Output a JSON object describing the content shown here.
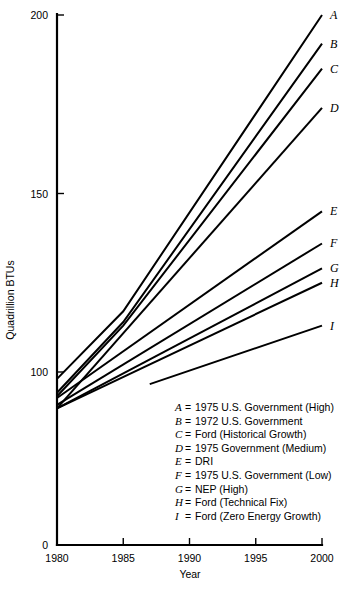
{
  "chart_data": {
    "type": "line",
    "title": "",
    "xlabel": "Year",
    "ylabel": "Quadrillion BTUs",
    "xlim": [
      1980,
      2000
    ],
    "ylim": [
      0,
      200
    ],
    "xticks": [
      1980,
      1985,
      1990,
      1995,
      2000
    ],
    "xticklabels": [
      "1980",
      "1985",
      "1990",
      "1995",
      "2000"
    ],
    "yticks": [
      0,
      100,
      150,
      200
    ],
    "yticklabels": [
      "0",
      "100",
      "150",
      "200"
    ],
    "grid": false,
    "legend_position": "inside-lower-right",
    "axis_note": "y-axis compressed below 100",
    "series": [
      {
        "key": "A",
        "name": "1975 U.S. Government (High)",
        "x": [
          1980,
          1985,
          2000
        ],
        "y": [
          96,
          117,
          200
        ]
      },
      {
        "key": "B",
        "name": "1972 U.S. Government",
        "x": [
          1980,
          1985,
          2000
        ],
        "y": [
          88,
          114,
          192
        ]
      },
      {
        "key": "C",
        "name": "Ford (Historical Growth)",
        "x": [
          1980,
          1985,
          2000
        ],
        "y": [
          86,
          113,
          185
        ]
      },
      {
        "key": "D",
        "name": "1975 Government (Medium)",
        "x": [
          1980,
          2000
        ],
        "y": [
          79,
          174
        ]
      },
      {
        "key": "E",
        "name": "DRI",
        "x": [
          1980,
          2000
        ],
        "y": [
          85,
          145
        ]
      },
      {
        "key": "F",
        "name": "1975 U.S. Government (Low)",
        "x": [
          1980,
          2000
        ],
        "y": [
          81,
          136
        ]
      },
      {
        "key": "G",
        "name": "NEP (High)",
        "x": [
          1980,
          2000
        ],
        "y": [
          79,
          129
        ]
      },
      {
        "key": "H",
        "name": "Ford (Technical Fix)",
        "x": [
          1980,
          2000
        ],
        "y": [
          79,
          125
        ]
      },
      {
        "key": "I",
        "name": "Ford (Zero Energy Growth)",
        "x": [
          1987,
          2000
        ],
        "y": [
          93,
          113
        ]
      }
    ],
    "legend_entries": [
      {
        "key": "A",
        "eq": "=",
        "name": "1975 U.S. Government (High)"
      },
      {
        "key": "B",
        "eq": "=",
        "name": "1972 U.S. Government"
      },
      {
        "key": "C",
        "eq": "=",
        "name": "Ford (Historical Growth)"
      },
      {
        "key": "D",
        "eq": "=",
        "name": "1975 Government (Medium)"
      },
      {
        "key": "E",
        "eq": "=",
        "name": "DRI"
      },
      {
        "key": "F",
        "eq": "=",
        "name": "1975 U.S. Government (Low)"
      },
      {
        "key": "G",
        "eq": "=",
        "name": "NEP (High)"
      },
      {
        "key": "H",
        "eq": "=",
        "name": "Ford (Technical Fix)"
      },
      {
        "key": "I",
        "eq": "=",
        "name": "Ford (Zero Energy Growth)"
      }
    ],
    "end_labels": [
      "A",
      "B",
      "C",
      "D",
      "E",
      "F",
      "G",
      "H",
      "I"
    ],
    "colors": {
      "line": "#000000",
      "axis": "#000000",
      "text": "#000000",
      "background": "#ffffff"
    }
  }
}
